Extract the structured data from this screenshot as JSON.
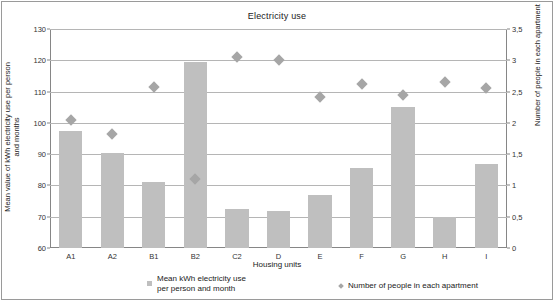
{
  "chart_data": {
    "type": "bar",
    "title": "Electricity use",
    "xlabel": "Housing units",
    "ylabel": "Mean value of kWh electricity use per person and months",
    "y2label": "Number of people in each apartment",
    "categories": [
      "A1",
      "A2",
      "B1",
      "B2",
      "C2",
      "D",
      "E",
      "F",
      "G",
      "H",
      "I"
    ],
    "ylim": [
      60,
      130
    ],
    "y2lim": [
      0,
      3.5
    ],
    "yticks": [
      "60",
      "70",
      "80",
      "90",
      "100",
      "110",
      "120",
      "130"
    ],
    "y2ticks": [
      "0",
      "0,5",
      "1",
      "1,5",
      "2",
      "2,5",
      "3",
      "3,5"
    ],
    "grid": true,
    "legend_position": "bottom",
    "series": [
      {
        "name": "Mean kWh electricity use\nper person and month",
        "type": "bar",
        "axis": "left",
        "color": "#bfbfbf",
        "values": [
          97.5,
          90.5,
          81.2,
          119.5,
          72.5,
          71.8,
          76.8,
          85.7,
          105.2,
          69.8,
          87.0
        ]
      },
      {
        "name": "Number of people in each apartment",
        "type": "scatter",
        "axis": "right",
        "color": "#a6a6a6",
        "values": [
          2.05,
          1.82,
          2.58,
          1.1,
          3.05,
          3.0,
          2.42,
          2.62,
          2.45,
          2.65,
          2.55
        ]
      }
    ]
  },
  "legend": {
    "bars_label": "Mean kWh electricity use\nper person and month",
    "markers_label": "Number of people in each apartment"
  },
  "colors": {
    "bar": "#bfbfbf",
    "marker": "#a6a6a6",
    "grid": "#b5b5b5",
    "axis": "#868686",
    "text": "#222222"
  }
}
